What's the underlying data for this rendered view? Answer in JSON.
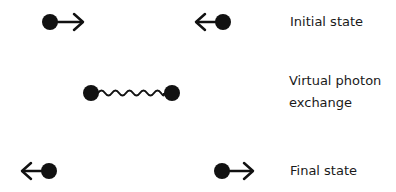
{
  "diagram": {
    "stages": [
      {
        "id": "initial",
        "label": "Initial state",
        "particles": [
          {
            "position": "left",
            "direction": "right"
          },
          {
            "position": "right",
            "direction": "left"
          }
        ]
      },
      {
        "id": "exchange",
        "label_line1": "Virtual photon",
        "label_line2": "exchange",
        "particles": [
          {
            "position": "left"
          },
          {
            "position": "right"
          }
        ],
        "connector": "wavy-photon-line"
      },
      {
        "id": "final",
        "label": "Final state",
        "particles": [
          {
            "position": "left",
            "direction": "left"
          },
          {
            "position": "right",
            "direction": "right"
          }
        ]
      }
    ],
    "colors": {
      "particle": "#111111",
      "line": "#111111",
      "background": "#ffffff"
    }
  }
}
